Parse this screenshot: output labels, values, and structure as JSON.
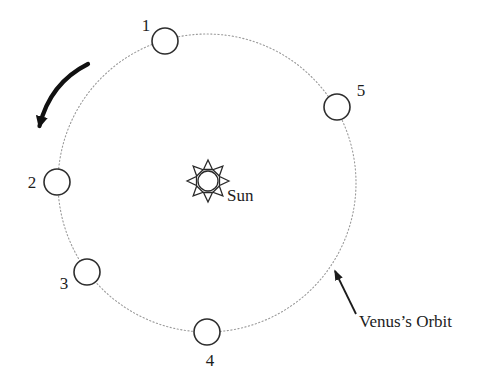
{
  "figure": {
    "type": "orbital-diagram",
    "background_color": "#ffffff",
    "ink_color": "#1c1c1c",
    "orbit_line_color": "#9a9a9a"
  },
  "diagram": {
    "sun": {
      "label": "Sun",
      "x": 208,
      "y": 181,
      "disc_radius": 10
    },
    "orbit": {
      "label": "Venus’s Orbit",
      "cx": 207,
      "cy": 183,
      "r": 149
    },
    "planet_radius": 13,
    "positions": [
      {
        "label": "1",
        "x": 165,
        "y": 41
      },
      {
        "label": "2",
        "x": 57,
        "y": 182
      },
      {
        "label": "3",
        "x": 87,
        "y": 272
      },
      {
        "label": "4",
        "x": 207,
        "y": 332
      },
      {
        "label": "5",
        "x": 337,
        "y": 107
      }
    ]
  }
}
